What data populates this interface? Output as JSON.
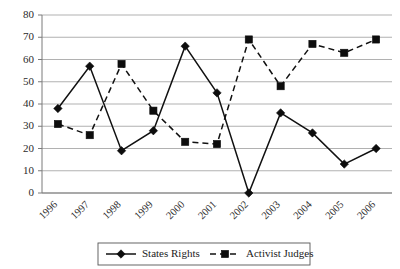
{
  "chart_data": {
    "type": "line",
    "title": "",
    "subtitle": "",
    "xlabel": "",
    "ylabel": "",
    "categories": [
      "1996",
      "1997",
      "1998",
      "1999",
      "2000",
      "2001",
      "2002",
      "2003",
      "2004",
      "2005",
      "2006"
    ],
    "ylim": [
      0,
      80
    ],
    "ytick_labels": [
      "0",
      "10",
      "20",
      "30",
      "40",
      "50",
      "60",
      "70",
      "80"
    ],
    "ytick_values": [
      0,
      10,
      20,
      30,
      40,
      50,
      60,
      70,
      80
    ],
    "grid": "horizontal",
    "legend_position": "bottom",
    "series": [
      {
        "name": "States Rights",
        "marker": "diamond",
        "line_style": "solid",
        "color": "#111111",
        "values": [
          38,
          57,
          19,
          28,
          66,
          45,
          0,
          36,
          27,
          13,
          20
        ]
      },
      {
        "name": "Activist Judges",
        "marker": "square",
        "line_style": "dashed",
        "color": "#111111",
        "values": [
          31,
          26,
          58,
          37,
          23,
          22,
          69,
          48,
          67,
          63,
          69
        ]
      }
    ]
  },
  "legend": {
    "entries": [
      {
        "label": "States Rights",
        "marker": "diamond",
        "line_style": "solid"
      },
      {
        "label": "Activist Judges",
        "marker": "square",
        "line_style": "dashed"
      }
    ]
  }
}
